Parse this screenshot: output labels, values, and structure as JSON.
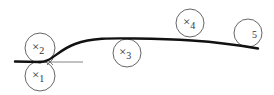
{
  "diagram": {
    "title": "",
    "rollers": [
      {
        "id": "roller-1",
        "label": "×",
        "subscript": "1",
        "cx": 40,
        "cy": 76,
        "r": 15
      },
      {
        "id": "roller-2",
        "label": "×",
        "subscript": "2",
        "cx": 40,
        "cy": 48,
        "r": 15
      },
      {
        "id": "roller-3",
        "label": "×",
        "subscript": "3",
        "cx": 127,
        "cy": 53,
        "r": 14
      },
      {
        "id": "roller-4",
        "label": "×",
        "subscript": "4",
        "cx": 190,
        "cy": 23,
        "r": 14
      },
      {
        "id": "roller-5",
        "label": "",
        "subscript": "5",
        "cx": 248,
        "cy": 33,
        "r": 14
      }
    ],
    "colors": {
      "stroke": "#222222",
      "circle": "#555555",
      "text": "#333333"
    }
  }
}
